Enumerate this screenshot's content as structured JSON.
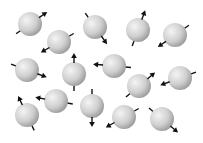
{
  "diagram": {
    "sphere_radius": 12,
    "sphere_color_light": "#f2f2f2",
    "sphere_color_dark": "#9a9a9a",
    "arrow_color": "#111111",
    "spheres": [
      {
        "id": 1,
        "cx": 30,
        "cy": 24,
        "angle": -35
      },
      {
        "id": 2,
        "cx": 59,
        "cy": 42,
        "angle": 150
      },
      {
        "id": 3,
        "cx": 95,
        "cy": 27,
        "angle": 55
      },
      {
        "id": 4,
        "cx": 138,
        "cy": 30,
        "angle": -70
      },
      {
        "id": 5,
        "cx": 175,
        "cy": 35,
        "angle": 145
      },
      {
        "id": 6,
        "cx": 27,
        "cy": 70,
        "angle": 20
      },
      {
        "id": 7,
        "cx": 74,
        "cy": 74,
        "angle": -90
      },
      {
        "id": 8,
        "cx": 114,
        "cy": 66,
        "angle": 185
      },
      {
        "id": 9,
        "cx": 139,
        "cy": 86,
        "angle": -40
      },
      {
        "id": 10,
        "cx": 180,
        "cy": 78,
        "angle": 160
      },
      {
        "id": 11,
        "cx": 56,
        "cy": 101,
        "angle": 190
      },
      {
        "id": 12,
        "cx": 92,
        "cy": 106,
        "angle": 90
      },
      {
        "id": 13,
        "cx": 27,
        "cy": 115,
        "angle": -115
      },
      {
        "id": 14,
        "cx": 124,
        "cy": 117,
        "angle": 150
      },
      {
        "id": 15,
        "cx": 162,
        "cy": 119,
        "angle": 40
      }
    ]
  }
}
